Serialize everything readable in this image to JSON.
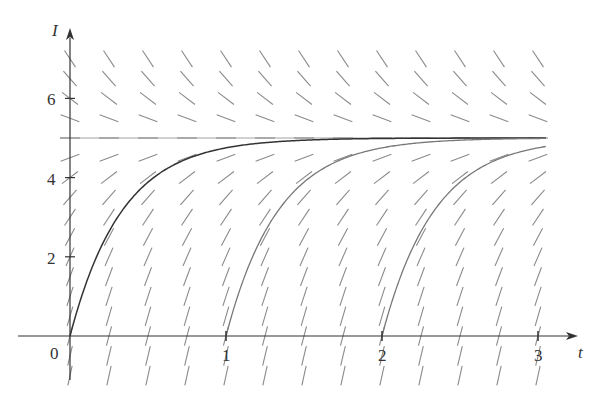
{
  "chart_data": {
    "type": "line",
    "title": "",
    "subtitle": "Direction field for dI/dt = 15 - 3I with solution curves",
    "xlabel": "t",
    "ylabel": "I",
    "xlim": [
      -0.33,
      3.3
    ],
    "ylim": [
      -1.2,
      7.8
    ],
    "x_ticks": [
      1,
      2,
      3
    ],
    "x_tick_labels": [
      "1",
      "2",
      "3"
    ],
    "y_ticks": [
      2,
      4,
      6
    ],
    "y_tick_labels": [
      "2",
      "4",
      "6"
    ],
    "origin_label": "0",
    "grid": false,
    "legend": null,
    "slope_field": {
      "equation": "dI/dt = 15 - 3I",
      "t_values": [
        0,
        0.25,
        0.5,
        0.75,
        1.0,
        1.25,
        1.5,
        1.75,
        2.0,
        2.25,
        2.5,
        2.75,
        3.0
      ],
      "I_values": [
        -1,
        -0.5,
        0,
        0.5,
        1,
        1.5,
        2,
        2.5,
        3,
        3.5,
        4,
        4.5,
        5,
        5.5,
        6,
        6.5,
        7
      ]
    },
    "equilibrium": {
      "I": 5,
      "style": "dashed"
    },
    "series": [
      {
        "name": "solution from t=0",
        "t0": 0,
        "I0": 0,
        "formula": "I = 5(1 - e^{-3(t-0)})",
        "color": "#333333",
        "x": [
          0,
          0.25,
          0.5,
          0.75,
          1.0,
          1.5,
          2.0,
          3.0
        ],
        "y": [
          0,
          2.64,
          3.88,
          4.47,
          4.75,
          4.94,
          4.99,
          5.0
        ]
      },
      {
        "name": "solution from t=1",
        "t0": 1,
        "I0": 0,
        "formula": "I = 5(1 - e^{-3(t-1)})",
        "color": "#777777",
        "x": [
          1,
          1.25,
          1.5,
          1.75,
          2.0,
          2.5,
          3.0
        ],
        "y": [
          0,
          2.64,
          3.88,
          4.47,
          4.75,
          4.94,
          4.99
        ]
      },
      {
        "name": "solution from t=2",
        "t0": 2,
        "I0": 0,
        "formula": "I = 5(1 - e^{-3(t-2)})",
        "color": "#777777",
        "x": [
          2,
          2.25,
          2.5,
          2.75,
          3.0
        ],
        "y": [
          0,
          2.64,
          3.88,
          4.47,
          4.75
        ]
      }
    ],
    "colors": {
      "axes": "#333333",
      "slopes": "#8a8a8a",
      "curve_primary": "#333333",
      "curve_secondary": "#777777"
    }
  }
}
